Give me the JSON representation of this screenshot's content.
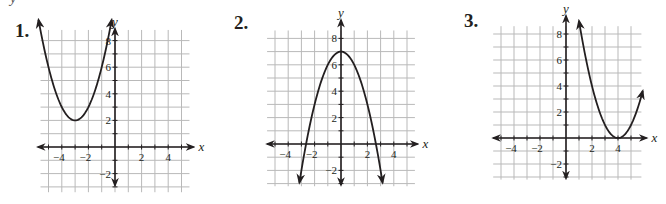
{
  "header_fragment": "y",
  "graphs": [
    {
      "number": "1.",
      "xlabel": "x",
      "ylabel": "y"
    },
    {
      "number": "2.",
      "xlabel": "x",
      "ylabel": "y"
    },
    {
      "number": "3.",
      "xlabel": "x",
      "ylabel": "y"
    }
  ],
  "chart_data": [
    {
      "type": "line",
      "title": "1.",
      "xlabel": "x",
      "ylabel": "y",
      "x_ticks": [
        -4,
        -2,
        2,
        4
      ],
      "y_ticks": [
        -2,
        2,
        4,
        6,
        8
      ],
      "grid": true,
      "xlim": [
        -5.5,
        5.5
      ],
      "ylim": [
        -3,
        9
      ],
      "function": "y = (x + 3)^2 + 2",
      "vertex": [
        -3,
        2
      ],
      "opens": "up",
      "x": [
        -5.8,
        -5,
        -4,
        -3,
        -2,
        -1,
        -0.2
      ],
      "y": [
        9.84,
        6,
        3,
        2,
        3,
        6,
        9.84
      ]
    },
    {
      "type": "line",
      "title": "2.",
      "xlabel": "x",
      "ylabel": "y",
      "x_ticks": [
        -4,
        -2,
        2,
        4
      ],
      "y_ticks": [
        -2,
        2,
        4,
        6,
        8
      ],
      "grid": true,
      "xlim": [
        -5.5,
        5.5
      ],
      "ylim": [
        -3,
        9
      ],
      "function": "y = -x^2 + 7",
      "vertex": [
        0,
        7
      ],
      "opens": "down",
      "x": [
        -3.1,
        -2.65,
        -2,
        -1,
        0,
        1,
        2,
        2.65,
        3.1
      ],
      "y": [
        -2.6,
        0,
        3,
        6,
        7,
        6,
        3,
        0,
        -2.6
      ]
    },
    {
      "type": "line",
      "title": "3.",
      "xlabel": "x",
      "ylabel": "y",
      "x_ticks": [
        -4,
        -2,
        2,
        4
      ],
      "y_ticks": [
        -2,
        2,
        4,
        6,
        8
      ],
      "grid": true,
      "xlim": [
        -5.5,
        6
      ],
      "ylim": [
        -3,
        9
      ],
      "function": "y = (x - 4)^2",
      "vertex": [
        4,
        0
      ],
      "opens": "up",
      "x": [
        1,
        2,
        3,
        4,
        5,
        5.8
      ],
      "y": [
        9,
        4,
        1,
        0,
        1,
        3.24
      ]
    }
  ]
}
